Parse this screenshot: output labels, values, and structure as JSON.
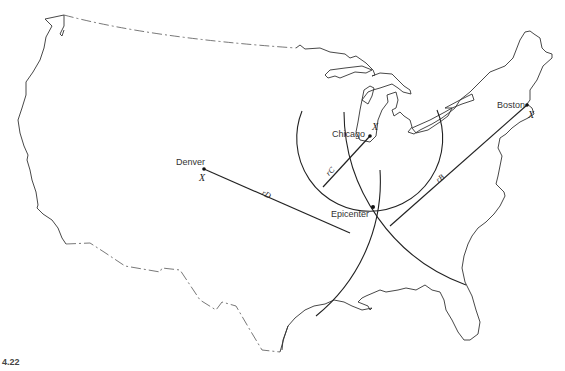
{
  "figure": {
    "type": "map-diagram",
    "caption_fragment": "4.22"
  },
  "stations": [
    {
      "name": "Denver",
      "marker": "X",
      "radius_label": "rD"
    },
    {
      "name": "Chicago",
      "marker": "X",
      "radius_label": "rC"
    },
    {
      "name": "Boston",
      "marker": "X",
      "radius_label": "rB"
    }
  ],
  "epicenter": {
    "label": "Epicenter"
  },
  "colors": {
    "line": "#222222",
    "outline": "#333333",
    "background": "#ffffff"
  }
}
